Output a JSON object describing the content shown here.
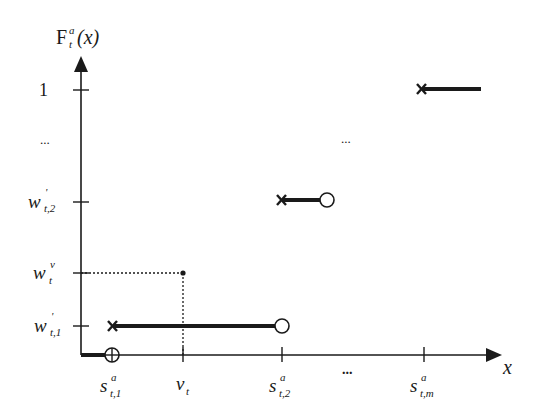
{
  "diagram": {
    "y_axis": {
      "label_main": "F",
      "label_sub": "t",
      "label_sup": "a",
      "label_arg": "(x)",
      "ticks": [
        {
          "main": "1",
          "sub": "",
          "sup": "",
          "y": 90
        },
        {
          "main": "...",
          "sub": "",
          "sup": "",
          "y": 140
        },
        {
          "main": "w",
          "sub": "t,2",
          "sup": "'",
          "y": 200
        },
        {
          "main": "w",
          "sub": "t",
          "sup": "v",
          "y": 272
        },
        {
          "main": "w",
          "sub": "t,1",
          "sup": "'",
          "y": 326
        }
      ]
    },
    "x_axis": {
      "label": "x",
      "ticks": [
        {
          "main": "s",
          "sub": "t,1",
          "sup": "a",
          "x": 112
        },
        {
          "main": "v",
          "sub": "t",
          "sup": "",
          "x": 183
        },
        {
          "main": "s",
          "sub": "t,2",
          "sup": "a",
          "x": 282
        },
        {
          "main": "...",
          "sub": "",
          "sup": "",
          "x": 352
        },
        {
          "main": "s",
          "sub": "t,m",
          "sup": "a",
          "x": 424
        }
      ]
    },
    "middle_ellipsis": "...",
    "colors": {
      "ink": "#1a1a1a",
      "background": "#ffffff"
    }
  }
}
